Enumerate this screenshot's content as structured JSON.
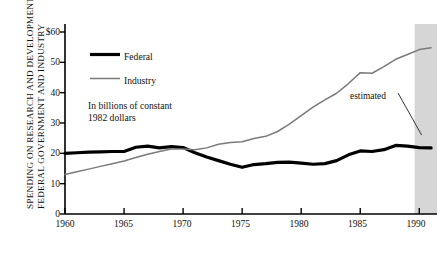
{
  "chart_data": {
    "type": "line",
    "title": "",
    "ylabel_lines": [
      "FEDERAL GOVERNMENT AND INDUSTRY",
      "SPENDING ON RESEARCH AND DEVELOPMENT"
    ],
    "xlabel": "",
    "note_lines": [
      "In billions of constant",
      "1982 dollars"
    ],
    "units": "billions of constant 1982 dollars",
    "xlim": [
      1960,
      1991.5
    ],
    "ylim": [
      0,
      60
    ],
    "yticks": [
      0,
      10,
      20,
      30,
      40,
      50,
      60
    ],
    "ytick_labels": [
      "0",
      "10",
      "20",
      "30",
      "40",
      "50",
      "$60"
    ],
    "xticks": [
      1960,
      1965,
      1970,
      1975,
      1980,
      1985,
      1990
    ],
    "xtick_labels": [
      "1960",
      "1965",
      "1970",
      "1975",
      "1980",
      "1985",
      "1990"
    ],
    "grid": false,
    "legend_position": "inside-top-left",
    "annotations": [
      {
        "text": "estimated",
        "x": 1986.0,
        "y": 33.0,
        "leader_to_x": 1990.2,
        "leader_to_y": 26.0
      }
    ],
    "shaded_regions": [
      {
        "label": "estimated",
        "x_start": 1989.6,
        "x_end": 1991.5,
        "color": "#d6d6d6"
      }
    ],
    "x": [
      1960,
      1961,
      1962,
      1963,
      1964,
      1965,
      1966,
      1967,
      1968,
      1969,
      1970,
      1971,
      1972,
      1973,
      1974,
      1975,
      1976,
      1977,
      1978,
      1979,
      1980,
      1981,
      1982,
      1983,
      1984,
      1985,
      1986,
      1987,
      1988,
      1989,
      1990,
      1991
    ],
    "series": [
      {
        "name": "Federal",
        "color": "#000000",
        "line_width": 3.2,
        "values": [
          20.0,
          20.2,
          20.4,
          20.5,
          20.6,
          20.6,
          22.0,
          22.4,
          21.8,
          22.2,
          21.9,
          20.2,
          18.8,
          17.6,
          16.4,
          15.4,
          16.3,
          16.6,
          17.0,
          17.1,
          16.8,
          16.4,
          16.6,
          17.6,
          19.5,
          20.8,
          20.6,
          21.2,
          22.6,
          22.4,
          21.9,
          21.8
        ]
      },
      {
        "name": "Industry",
        "color": "#7a7a7a",
        "line_width": 1.5,
        "values": [
          13.0,
          13.9,
          14.8,
          15.7,
          16.6,
          17.5,
          18.6,
          19.7,
          20.6,
          21.4,
          21.4,
          21.2,
          21.8,
          23.0,
          23.6,
          23.8,
          24.9,
          25.6,
          27.2,
          29.6,
          32.4,
          35.2,
          37.6,
          39.8,
          43.0,
          46.6,
          46.4,
          48.6,
          51.0,
          52.6,
          54.2,
          54.8
        ]
      }
    ],
    "legend": [
      {
        "label": "Federal",
        "color": "#000000",
        "line_width": 3.2
      },
      {
        "label": "Industry",
        "color": "#7a7a7a",
        "line_width": 1.5
      }
    ]
  }
}
